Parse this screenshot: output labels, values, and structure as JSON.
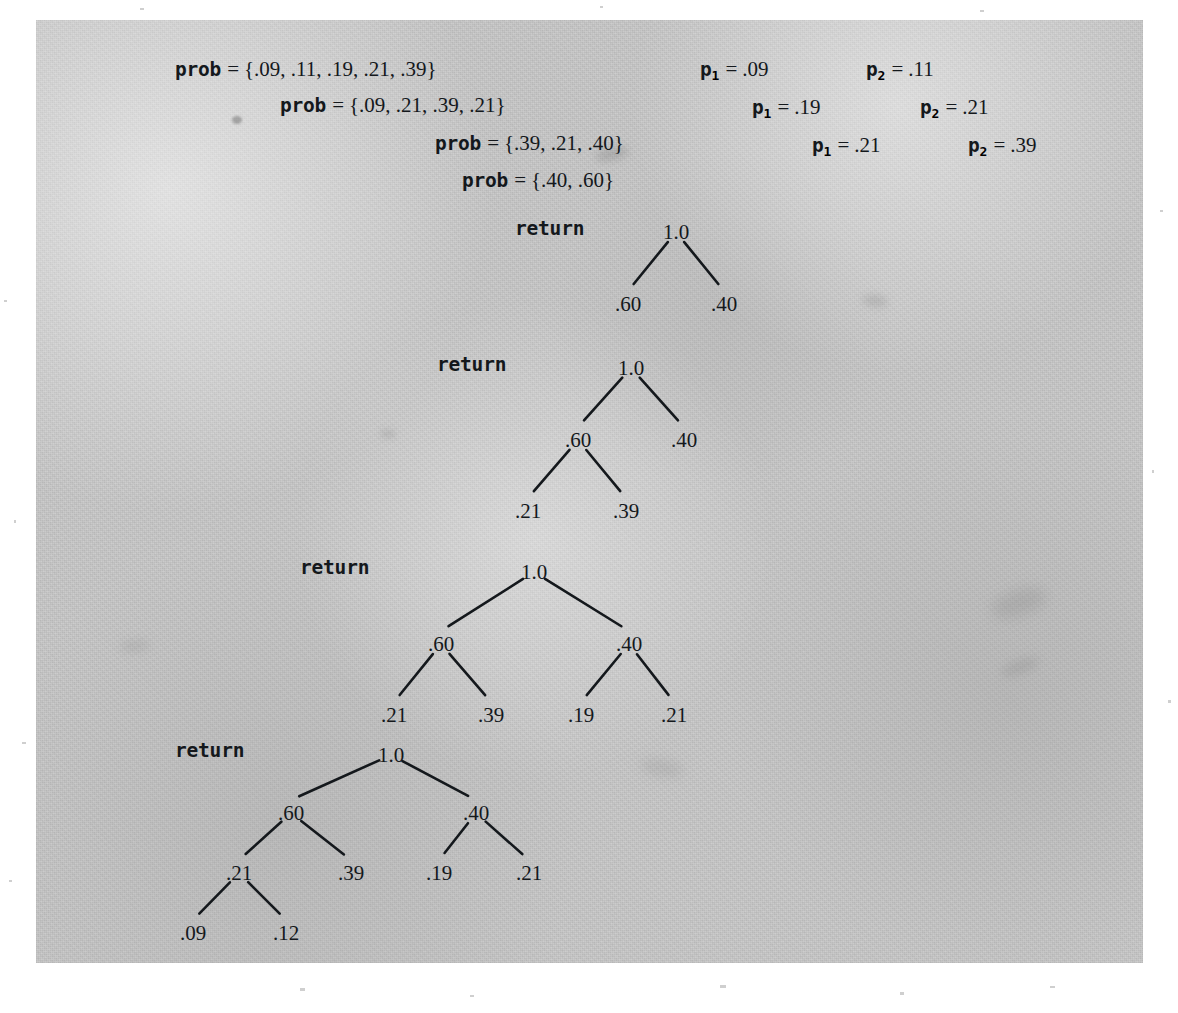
{
  "figure": {
    "kind": "huffman-tree-construction-trace",
    "background_color": "#c9c9c9",
    "ink_color": "#14181c",
    "panel": {
      "left": 36,
      "top": 20,
      "width": 1107,
      "height": 943
    }
  },
  "prob_lines": [
    {
      "name": "prob",
      "eq": "=",
      "value": "{.09, .11, .19, .21, .39}",
      "x": 175,
      "y": 57
    },
    {
      "name": "prob",
      "eq": "=",
      "value": "{.09, .21, .39, .21}",
      "x": 280,
      "y": 93
    },
    {
      "name": "prob",
      "eq": "=",
      "value": "{.39, .21, .40}",
      "x": 435,
      "y": 131
    },
    {
      "name": "prob",
      "eq": "=",
      "value": "{.40, .60}",
      "x": 462,
      "y": 168
    }
  ],
  "p_pairs": [
    {
      "p1_name": "p",
      "p1_sub": "1",
      "p1_eq": "=",
      "p1_value": ".09",
      "p1_x": 700,
      "p2_name": "p",
      "p2_sub": "2",
      "p2_eq": "=",
      "p2_value": ".11",
      "p2_x": 866,
      "y": 57
    },
    {
      "p1_name": "p",
      "p1_sub": "1",
      "p1_eq": "=",
      "p1_value": ".19",
      "p1_x": 752,
      "p2_name": "p",
      "p2_sub": "2",
      "p2_eq": "=",
      "p2_value": ".21",
      "p2_x": 920,
      "y": 95
    },
    {
      "p1_name": "p",
      "p1_sub": "1",
      "p1_eq": "=",
      "p1_value": ".21",
      "p1_x": 812,
      "p2_name": "p",
      "p2_sub": "2",
      "p2_eq": "=",
      "p2_value": ".39",
      "p2_x": 968,
      "y": 133
    }
  ],
  "trees": [
    {
      "id": "tree-1",
      "return_label": "return",
      "return_x": 515,
      "return_y": 217,
      "svg_left": 520,
      "svg_top": 205,
      "svg_width": 320,
      "svg_height": 120,
      "nodes": [
        {
          "id": "n-root",
          "label": "1.0",
          "x": 140,
          "y": 20
        },
        {
          "id": "n-l",
          "label": ".60",
          "x": 92,
          "y": 92
        },
        {
          "id": "n-r",
          "label": ".40",
          "x": 188,
          "y": 92
        }
      ],
      "edges": [
        {
          "from": "n-root",
          "to": "n-l"
        },
        {
          "from": "n-root",
          "to": "n-r"
        }
      ]
    },
    {
      "id": "tree-2",
      "return_label": "return",
      "return_x": 437,
      "return_y": 353,
      "svg_left": 440,
      "svg_top": 341,
      "svg_width": 330,
      "svg_height": 190,
      "nodes": [
        {
          "id": "n-root",
          "label": "1.0",
          "x": 175,
          "y": 20
        },
        {
          "id": "n-l",
          "label": ".60",
          "x": 122,
          "y": 92
        },
        {
          "id": "n-r",
          "label": ".40",
          "x": 228,
          "y": 92
        },
        {
          "id": "n-ll",
          "label": ".21",
          "x": 72,
          "y": 163
        },
        {
          "id": "n-lr",
          "label": ".39",
          "x": 170,
          "y": 163
        }
      ],
      "edges": [
        {
          "from": "n-root",
          "to": "n-l"
        },
        {
          "from": "n-root",
          "to": "n-r"
        },
        {
          "from": "n-l",
          "to": "n-ll"
        },
        {
          "from": "n-l",
          "to": "n-lr"
        }
      ]
    },
    {
      "id": "tree-3",
      "return_label": "return",
      "return_x": 300,
      "return_y": 556,
      "svg_left": 300,
      "svg_top": 545,
      "svg_width": 420,
      "svg_height": 190,
      "nodes": [
        {
          "id": "n-root",
          "label": "1.0",
          "x": 218,
          "y": 20
        },
        {
          "id": "n-l",
          "label": ".60",
          "x": 125,
          "y": 92
        },
        {
          "id": "n-r",
          "label": ".40",
          "x": 313,
          "y": 92
        },
        {
          "id": "n-ll",
          "label": ".21",
          "x": 78,
          "y": 163
        },
        {
          "id": "n-lr",
          "label": ".39",
          "x": 175,
          "y": 163
        },
        {
          "id": "n-rl",
          "label": ".19",
          "x": 265,
          "y": 163
        },
        {
          "id": "n-rr",
          "label": ".21",
          "x": 358,
          "y": 163
        }
      ],
      "edges": [
        {
          "from": "n-root",
          "to": "n-l"
        },
        {
          "from": "n-root",
          "to": "n-r"
        },
        {
          "from": "n-l",
          "to": "n-ll"
        },
        {
          "from": "n-l",
          "to": "n-lr"
        },
        {
          "from": "n-r",
          "to": "n-rl"
        },
        {
          "from": "n-r",
          "to": "n-rr"
        }
      ]
    },
    {
      "id": "tree-4",
      "return_label": "return",
      "return_x": 175,
      "return_y": 739,
      "svg_left": 175,
      "svg_top": 728,
      "svg_width": 420,
      "svg_height": 260,
      "nodes": [
        {
          "id": "n-root",
          "label": "1.0",
          "x": 200,
          "y": 20
        },
        {
          "id": "n-l",
          "label": ".60",
          "x": 100,
          "y": 78
        },
        {
          "id": "n-r",
          "label": ".40",
          "x": 285,
          "y": 78
        },
        {
          "id": "n-ll",
          "label": ".21",
          "x": 48,
          "y": 138
        },
        {
          "id": "n-lr",
          "label": ".39",
          "x": 160,
          "y": 138
        },
        {
          "id": "n-rl",
          "label": ".19",
          "x": 248,
          "y": 138
        },
        {
          "id": "n-rr",
          "label": ".21",
          "x": 338,
          "y": 138
        },
        {
          "id": "n-lll",
          "label": ".09",
          "x": 2,
          "y": 198
        },
        {
          "id": "n-llr",
          "label": ".12",
          "x": 95,
          "y": 198
        }
      ],
      "edges": [
        {
          "from": "n-root",
          "to": "n-l"
        },
        {
          "from": "n-root",
          "to": "n-r"
        },
        {
          "from": "n-l",
          "to": "n-ll"
        },
        {
          "from": "n-l",
          "to": "n-lr"
        },
        {
          "from": "n-r",
          "to": "n-rl"
        },
        {
          "from": "n-r",
          "to": "n-rr"
        },
        {
          "from": "n-ll",
          "to": "n-lll"
        },
        {
          "from": "n-ll",
          "to": "n-llr"
        }
      ]
    }
  ],
  "smudges": [
    {
      "x": 595,
      "y": 148,
      "w": 34,
      "h": 12,
      "color": "rgba(110,110,110,0.30)",
      "blur": 4,
      "rot": -12
    },
    {
      "x": 862,
      "y": 296,
      "w": 26,
      "h": 10,
      "color": "rgba(110,110,110,0.26)",
      "blur": 4,
      "rot": 8
    },
    {
      "x": 990,
      "y": 590,
      "w": 58,
      "h": 26,
      "color": "rgba(125,125,125,0.24)",
      "blur": 7,
      "rot": -18
    },
    {
      "x": 1000,
      "y": 660,
      "w": 40,
      "h": 14,
      "color": "rgba(125,125,125,0.22)",
      "blur": 5,
      "rot": -20
    },
    {
      "x": 232,
      "y": 116,
      "w": 10,
      "h": 8,
      "color": "rgba(90,90,90,0.42)",
      "blur": 1,
      "rot": 0
    },
    {
      "x": 380,
      "y": 430,
      "w": 16,
      "h": 8,
      "color": "rgba(120,120,120,0.24)",
      "blur": 3,
      "rot": 0
    },
    {
      "x": 640,
      "y": 760,
      "w": 44,
      "h": 16,
      "color": "rgba(125,125,125,0.20)",
      "blur": 6,
      "rot": 10
    },
    {
      "x": 120,
      "y": 640,
      "w": 30,
      "h": 12,
      "color": "rgba(125,125,125,0.20)",
      "blur": 5,
      "rot": -6
    }
  ],
  "margin_specks": [
    {
      "x": 4,
      "y": 300,
      "w": 3,
      "h": 2
    },
    {
      "x": 14,
      "y": 520,
      "w": 2,
      "h": 3
    },
    {
      "x": 22,
      "y": 742,
      "w": 4,
      "h": 2
    },
    {
      "x": 9,
      "y": 880,
      "w": 3,
      "h": 2
    },
    {
      "x": 1160,
      "y": 210,
      "w": 3,
      "h": 2
    },
    {
      "x": 1152,
      "y": 470,
      "w": 2,
      "h": 3
    },
    {
      "x": 1168,
      "y": 700,
      "w": 3,
      "h": 3
    },
    {
      "x": 300,
      "y": 988,
      "w": 5,
      "h": 3
    },
    {
      "x": 470,
      "y": 995,
      "w": 4,
      "h": 2
    },
    {
      "x": 720,
      "y": 985,
      "w": 6,
      "h": 3
    },
    {
      "x": 900,
      "y": 992,
      "w": 4,
      "h": 3
    },
    {
      "x": 1050,
      "y": 986,
      "w": 5,
      "h": 2
    },
    {
      "x": 140,
      "y": 8,
      "w": 4,
      "h": 2
    },
    {
      "x": 600,
      "y": 6,
      "w": 3,
      "h": 2
    },
    {
      "x": 980,
      "y": 10,
      "w": 4,
      "h": 2
    }
  ]
}
